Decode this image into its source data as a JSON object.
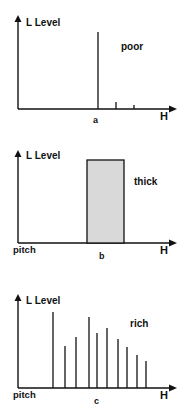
{
  "panels": [
    {
      "id": "a",
      "y_label": "L Level",
      "x_label": "H",
      "caption": "a",
      "descriptor": "poor",
      "pitch_label": "",
      "origin": {
        "x": 18,
        "y": 109
      },
      "y_top": 15,
      "x_end": 177,
      "lines": [
        {
          "x": 98,
          "top": 32
        },
        {
          "x": 116,
          "top": 102
        },
        {
          "x": 134,
          "top": 105
        }
      ]
    },
    {
      "id": "b",
      "y_label": "L Level",
      "x_label": "H",
      "caption": "b",
      "descriptor": "thick",
      "pitch_label": "pitch",
      "origin": {
        "x": 18,
        "y": 243
      },
      "y_top": 150,
      "x_end": 177,
      "band": {
        "x1": 87,
        "x2": 124,
        "top": 160,
        "fill": "#d9d9d9"
      }
    },
    {
      "id": "c",
      "y_label": "L Level",
      "x_label": "H",
      "caption": "c",
      "descriptor": "rich",
      "pitch_label": "pitch",
      "origin": {
        "x": 18,
        "y": 388
      },
      "y_top": 294,
      "x_end": 177,
      "lines": [
        {
          "x": 53,
          "top": 312
        },
        {
          "x": 65,
          "top": 346
        },
        {
          "x": 76,
          "top": 337
        },
        {
          "x": 89,
          "top": 317
        },
        {
          "x": 97,
          "top": 333
        },
        {
          "x": 107,
          "top": 328
        },
        {
          "x": 118,
          "top": 339
        },
        {
          "x": 127,
          "top": 347
        },
        {
          "x": 137,
          "top": 355
        },
        {
          "x": 146,
          "top": 361
        }
      ]
    }
  ],
  "text": {
    "a_ylabel": "L Level",
    "a_xlabel": "H",
    "a_caption": "a",
    "a_desc": "poor",
    "b_ylabel": "L Level",
    "b_xlabel": "H",
    "b_caption": "b",
    "b_desc": "thick",
    "b_pitch": "pitch",
    "c_ylabel": "L Level",
    "c_xlabel": "H",
    "c_caption": "c",
    "c_desc": "rich",
    "c_pitch": "pitch"
  }
}
